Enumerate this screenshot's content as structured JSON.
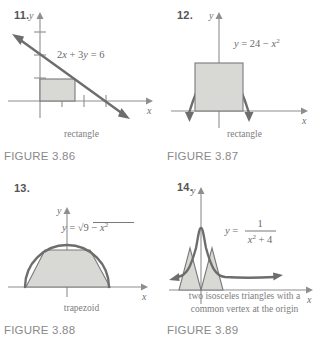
{
  "page": {
    "background": "#ffffff",
    "shade_color": "#d8d8d4",
    "curve_color": "#6d6d6d",
    "axis_color": "#8e8e8e",
    "text_color": "#6a6a6a"
  },
  "figures": [
    {
      "number": "11.",
      "equation": "2x + 3y = 6",
      "equation_parts": {
        "lhs_a": "2",
        "var_x": "x",
        "plus": "+",
        "lhs_b": "3",
        "var_y": "y",
        "eq": "=",
        "rhs": "6"
      },
      "shape_label": "rectangle",
      "caption": "FIGURE 3.86",
      "axis_x_label": "x",
      "axis_y_label": "y",
      "graph_type": "line-with-inscribed-rectangle"
    },
    {
      "number": "12.",
      "equation": "y = 24 − x²",
      "equation_parts": {
        "var_y": "y",
        "eq": "=",
        "const": "24",
        "minus": "−",
        "var_x": "x",
        "exp": "2"
      },
      "shape_label": "rectangle",
      "caption": "FIGURE 3.87",
      "axis_x_label": "x",
      "axis_y_label": "y",
      "graph_type": "downward-parabola-with-inscribed-rectangle"
    },
    {
      "number": "13.",
      "equation": "y = √(9 − x²)",
      "equation_parts": {
        "var_y": "y",
        "eq": "=",
        "radicand_const": "9",
        "minus": "−",
        "var_x": "x",
        "exp": "2"
      },
      "shape_label": "trapezoid",
      "caption": "FIGURE 3.88",
      "axis_x_label": "x",
      "axis_y_label": "y",
      "graph_type": "semicircle-with-inscribed-trapezoid"
    },
    {
      "number": "14.",
      "equation": "y = 1/(x² + 4)",
      "equation_parts": {
        "var_y": "y",
        "eq": "=",
        "numerator": "1",
        "var_x": "x",
        "exp": "2",
        "plus": "+",
        "denom_const": "4"
      },
      "shape_label_line1": "two isosceles triangles with a",
      "shape_label_line2": "common vertex at the origin",
      "caption": "FIGURE 3.89",
      "axis_x_label": "x",
      "axis_y_label": "y",
      "graph_type": "bell-curve-with-two-inscribed-triangles"
    }
  ]
}
